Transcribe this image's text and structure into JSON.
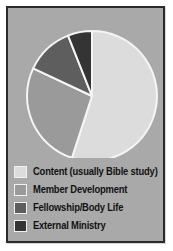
{
  "figure": {
    "background_color": "#ffffff",
    "panel_color": "#a9a9a9",
    "border_color": "#2a2a2a",
    "separator_color": "#f5f5f5"
  },
  "legend": {
    "items": [
      {
        "label": "Content (usually Bible study)",
        "color": "#dcdcdc"
      },
      {
        "label": "Member Development",
        "color": "#9a9a9a"
      },
      {
        "label": "Fellowship/Body Life",
        "color": "#5e5e5e"
      },
      {
        "label": "External Ministry",
        "color": "#343434"
      }
    ]
  },
  "chart_data": {
    "type": "pie",
    "title": "",
    "labels": [
      "Content (usually Bible study)",
      "Member Development",
      "Fellowship/Body Life",
      "External Ministry"
    ],
    "values": [
      55,
      27,
      12,
      6
    ],
    "colors": [
      "#dcdcdc",
      "#9a9a9a",
      "#5e5e5e",
      "#343434"
    ],
    "start_angle": 0,
    "direction": "clockwise",
    "center": [
      84,
      88
    ],
    "radius": 65,
    "wedge_edge_color": "#f5f5f5",
    "wedge_edge_width": 2,
    "legend_position": "bottom-left",
    "grid": false
  }
}
